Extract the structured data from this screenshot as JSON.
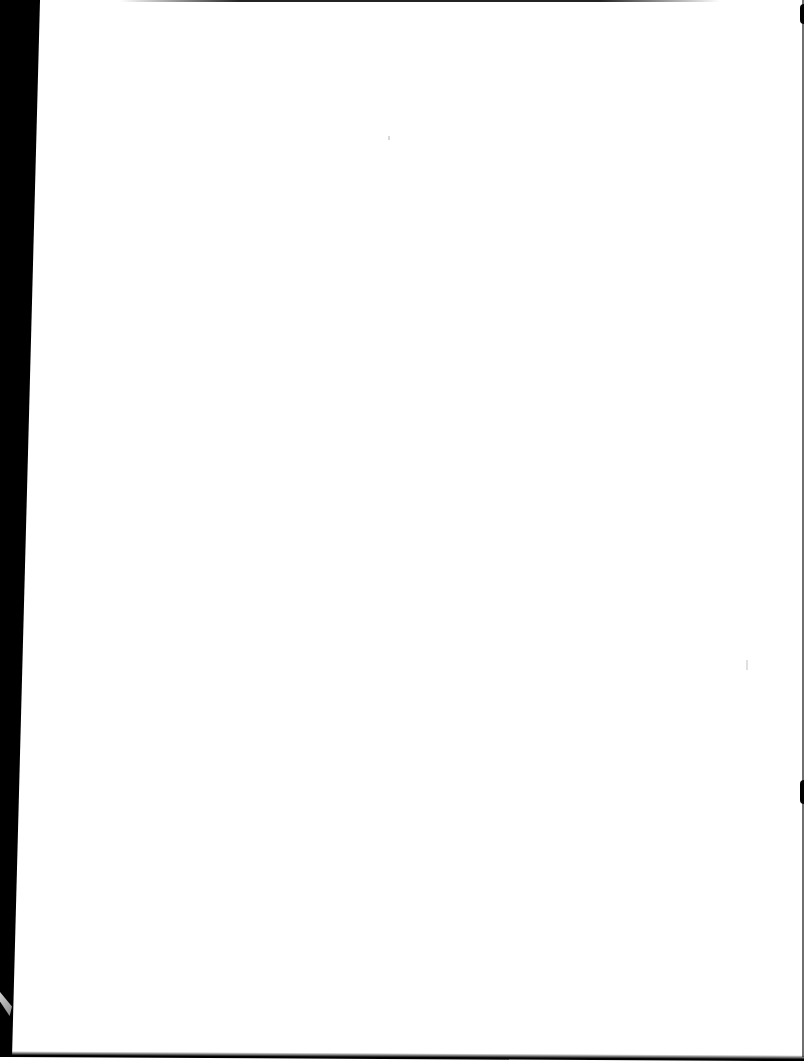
{
  "document": {
    "type": "scanned-page",
    "state": "blank",
    "text": "",
    "colors": {
      "page": "#ffffff",
      "scan_border": "#000000"
    }
  }
}
